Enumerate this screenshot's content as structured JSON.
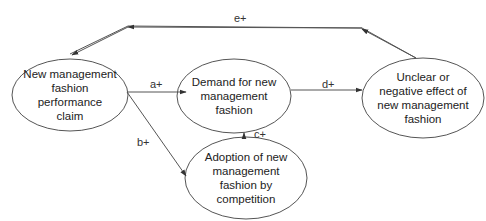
{
  "diagram": {
    "type": "causal-loop",
    "colors": {
      "stroke": "#555555",
      "text": "#222222",
      "background": "#ffffff"
    },
    "nodes": [
      {
        "id": "claim",
        "label": "New management fashion performance claim",
        "lines": [
          "New management",
          "fashion",
          "performance",
          "claim"
        ]
      },
      {
        "id": "demand",
        "label": "Demand for new management fashion",
        "lines": [
          "Demand for new",
          "management",
          "fashion"
        ]
      },
      {
        "id": "effect",
        "label": "Unclear or negative effect of new management fashion",
        "lines": [
          "Unclear or",
          "negative effect of",
          "new management",
          "fashion"
        ]
      },
      {
        "id": "adoption",
        "label": "Adoption of new management fashion by competition",
        "lines": [
          "Adoption of new",
          "management",
          "fashion by",
          "competition"
        ]
      }
    ],
    "edges": [
      {
        "id": "a",
        "from": "claim",
        "to": "demand",
        "label": "a+"
      },
      {
        "id": "b",
        "from": "claim",
        "to": "adoption",
        "label": "b+"
      },
      {
        "id": "c",
        "from": "adoption",
        "to": "demand",
        "label": "c+"
      },
      {
        "id": "d",
        "from": "demand",
        "to": "effect",
        "label": "d+"
      },
      {
        "id": "e",
        "from": "effect",
        "to": "claim",
        "label": "e+"
      }
    ]
  }
}
